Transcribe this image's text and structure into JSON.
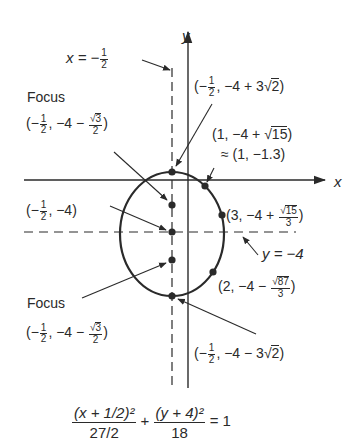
{
  "axes": {
    "x_label": "x",
    "y_label": "y"
  },
  "lines": {
    "vertical_dashed": {
      "lhs": "x = −",
      "frac_num": "1",
      "frac_den": "2"
    },
    "horizontal_dashed": {
      "label": "y = −4"
    }
  },
  "points": {
    "top_vertex": {
      "pre": "(−",
      "frac_num": "1",
      "frac_den": "2",
      "mid": ", −4 + 3",
      "sqrt": "2",
      "post": ")"
    },
    "upper_focus": {
      "title": "Focus",
      "pre": "(−",
      "frac_num": "1",
      "frac_den": "2",
      "mid": ", −4 − ",
      "sqrt_num": "3",
      "den": "2",
      "post": ")"
    },
    "center": {
      "pre": "(−",
      "frac_num": "1",
      "frac_den": "2",
      "post": ", −4)"
    },
    "lower_focus": {
      "title": "Focus",
      "pre": "(−",
      "frac_num": "1",
      "frac_den": "2",
      "mid": ", −4 − ",
      "sqrt_num": "3",
      "den": "2",
      "post": ")"
    },
    "bottom_vertex": {
      "pre": "(−",
      "frac_num": "1",
      "frac_den": "2",
      "mid": ", −4 − 3",
      "sqrt": "2",
      "post": ")"
    },
    "x_intercept": {
      "line1_pre": "(1, −4 + ",
      "sqrt": "15",
      "line1_post": ")",
      "line2": "≈ (1, −1.3)"
    },
    "right_point": {
      "pre": "(3, −4 + ",
      "sqrt_num": "15",
      "den": "3",
      "post": ")"
    },
    "lower_right_point": {
      "pre": "(2, −4 − ",
      "sqrt_num": "87",
      "den": "3",
      "post": ")"
    }
  },
  "equation": {
    "term1_num": "(x + 1/2)²",
    "term1_den": "27/2",
    "plus": "+",
    "term2_num": "(y + 4)²",
    "term2_den": "18",
    "rhs": "= 1"
  },
  "colors": {
    "ink": "#2a2a2a",
    "background": "#ffffff"
  }
}
